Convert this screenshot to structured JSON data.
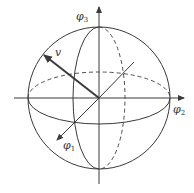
{
  "diagram": {
    "type": "sphere-coordinate-axes",
    "colors": {
      "stroke": "#3a3a3a",
      "background": "#ffffff"
    },
    "labels": {
      "phi3": {
        "symbol": "φ",
        "subscript": "3"
      },
      "phi2": {
        "symbol": "φ",
        "subscript": "2"
      },
      "phi1": {
        "symbol": "φ",
        "subscript": "1"
      },
      "vector": "v"
    }
  }
}
